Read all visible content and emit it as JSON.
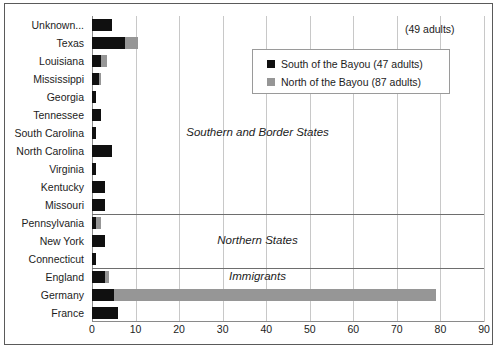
{
  "chart_data": {
    "type": "bar",
    "orientation": "horizontal",
    "stacked": true,
    "title": "",
    "xlabel": "",
    "ylabel": "",
    "xlim": [
      0,
      90
    ],
    "xticks": [
      "0",
      "10",
      "20",
      "30",
      "40",
      "50",
      "60",
      "70",
      "80",
      "90"
    ],
    "grid": true,
    "legend_position": "upper-right-inside",
    "categories": [
      "Unknown...",
      "Texas",
      "Louisiana",
      "Mississippi",
      "Georgia",
      "Tennessee",
      "South Carolina",
      "North Carolina",
      "Virginia",
      "Kentucky",
      "Missouri",
      "Pennsylvania",
      "New York",
      "Connecticut",
      "England",
      "Germany",
      "France"
    ],
    "series": [
      {
        "name": "South of the Bayou (47 adults)",
        "color": "#101010",
        "values": [
          4.5,
          7.5,
          2,
          1.5,
          1,
          2,
          1,
          4.5,
          1,
          3,
          3,
          1,
          3,
          1,
          3,
          5,
          6
        ]
      },
      {
        "name": "North of the Bayou (87 adults)",
        "color": "#969696",
        "values": [
          0,
          3,
          1.5,
          0.5,
          0,
          0,
          0,
          0,
          0,
          0,
          0,
          1,
          0,
          0,
          1,
          74,
          0
        ]
      }
    ],
    "annotations": [
      {
        "text": "Southern and Border States",
        "x": 38,
        "category_index": 6,
        "style": "italic"
      },
      {
        "text": "Northern States",
        "x": 38,
        "category_index": 12,
        "style": "italic"
      },
      {
        "text": "Immigrants",
        "x": 38,
        "category_index": 14,
        "style": "italic"
      }
    ],
    "corner_note": "(49 adults)",
    "section_dividers": [
      11,
      14
    ]
  },
  "legend": {
    "entries": [
      {
        "label": "South of the Bayou (47 adults)",
        "swatch": "#101010"
      },
      {
        "label": "North of the Bayou (87 adults)",
        "swatch": "#969696"
      }
    ]
  },
  "colors": {
    "south": "#101010",
    "north": "#969696",
    "grid": "#c8c8c8",
    "axis": "#8a8a8a",
    "divider": "#6e6e6e",
    "frame": "#5a5a5a"
  }
}
